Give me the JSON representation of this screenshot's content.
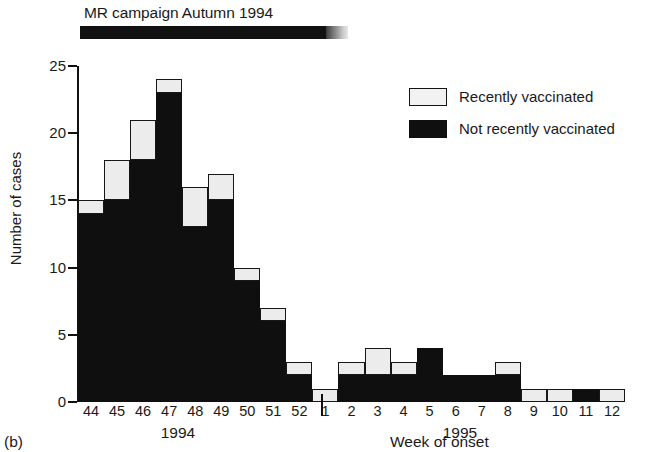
{
  "figure": {
    "panel_label": "(b)",
    "campaign_annotation": "MR campaign Autumn 1994"
  },
  "legend": {
    "position": "top-right",
    "items": [
      {
        "key": "recent",
        "label": "Recently vaccinated",
        "swatch": "light-box",
        "color": "#ececec"
      },
      {
        "key": "not_recent",
        "label": "Not recently vaccinated",
        "swatch": "black-box",
        "color": "#100f0f"
      }
    ]
  },
  "axes": {
    "y_title": "Number of cases",
    "x_title": "Week of onset",
    "y_ticks": [
      "0",
      "5",
      "10",
      "15",
      "20",
      "25"
    ],
    "year_groups": [
      {
        "label": "1994",
        "weeks": [
          "44",
          "45",
          "46",
          "47",
          "48",
          "49",
          "50",
          "51",
          "52"
        ]
      },
      {
        "label": "1995",
        "weeks": [
          "1",
          "2",
          "3",
          "4",
          "5",
          "6",
          "7",
          "8",
          "9",
          "10",
          "11",
          "12"
        ]
      }
    ]
  },
  "chart_data": {
    "type": "bar",
    "stacked": true,
    "title": "MR campaign Autumn 1994",
    "xlabel": "Week of onset",
    "ylabel": "Number of cases",
    "ylim": [
      0,
      25
    ],
    "yticks": [
      0,
      5,
      10,
      15,
      20,
      25
    ],
    "grid": false,
    "legend_position": "upper right",
    "categories": [
      "44",
      "45",
      "46",
      "47",
      "48",
      "49",
      "50",
      "51",
      "52",
      "1",
      "2",
      "3",
      "4",
      "5",
      "6",
      "7",
      "8",
      "9",
      "10",
      "11",
      "12"
    ],
    "category_years": [
      "1994",
      "1994",
      "1994",
      "1994",
      "1994",
      "1994",
      "1994",
      "1994",
      "1994",
      "1995",
      "1995",
      "1995",
      "1995",
      "1995",
      "1995",
      "1995",
      "1995",
      "1995",
      "1995",
      "1995",
      "1995"
    ],
    "series": [
      {
        "name": "Not recently vaccinated",
        "color": "#100f0f",
        "values": [
          14,
          15,
          18,
          23,
          13,
          15,
          9,
          6,
          2,
          0,
          2,
          2,
          2,
          4,
          2,
          2,
          2,
          0,
          0,
          1,
          0
        ]
      },
      {
        "name": "Recently vaccinated",
        "color": "#ececec",
        "values": [
          1,
          3,
          3,
          1,
          3,
          2,
          1,
          1,
          1,
          1,
          1,
          2,
          1,
          0,
          0,
          0,
          1,
          1,
          1,
          0,
          1
        ]
      }
    ],
    "totals": [
      15,
      18,
      21,
      24,
      16,
      17,
      10,
      7,
      3,
      1,
      3,
      4,
      3,
      4,
      2,
      2,
      3,
      1,
      1,
      1,
      1
    ],
    "annotations": [
      {
        "text": "MR campaign Autumn 1994",
        "type": "period-bar",
        "start_week": "44",
        "end_week": "52"
      }
    ]
  }
}
